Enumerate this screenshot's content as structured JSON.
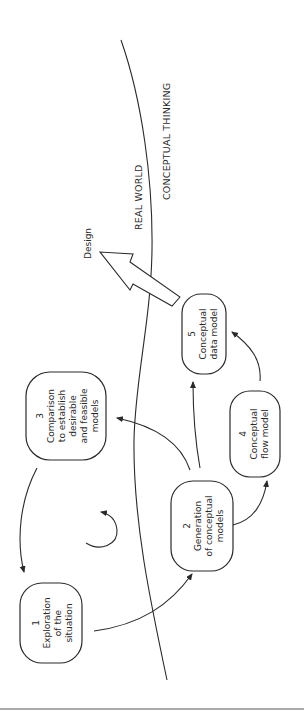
{
  "diagram": {
    "regions": {
      "left": "REAL WORLD",
      "right": "CONCEPTUAL THINKING"
    },
    "output_label": "Design",
    "nodes": [
      {
        "id": 1,
        "number": "1",
        "lines": [
          "Exploration",
          "of the",
          "situation"
        ]
      },
      {
        "id": 2,
        "number": "2",
        "lines": [
          "Generation",
          "of conceptual",
          "models"
        ]
      },
      {
        "id": 3,
        "number": "3",
        "lines": [
          "Comparison",
          "to establish",
          "desirable",
          "and feasible",
          "models"
        ]
      },
      {
        "id": 4,
        "number": "4",
        "lines": [
          "Conceptual",
          "flow model"
        ]
      },
      {
        "id": 5,
        "number": "5",
        "lines": [
          "Conceptual",
          "data model"
        ]
      }
    ],
    "edges": [
      {
        "from": 1,
        "to": 2
      },
      {
        "from": 2,
        "to": 3
      },
      {
        "from": 3,
        "to": 1
      },
      {
        "from": 2,
        "to": 4
      },
      {
        "from": 2,
        "to": 5
      },
      {
        "from": 4,
        "to": 5
      },
      {
        "from": 5,
        "to": "Design"
      }
    ],
    "cycle_indicator": "clockwise-cycle"
  }
}
